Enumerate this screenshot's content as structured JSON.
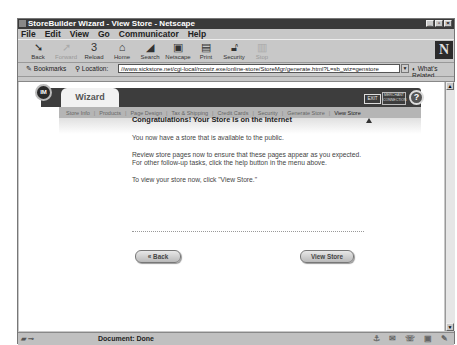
{
  "window": {
    "title": "StoreBuilder Wizard - View Store - Netscape",
    "controls": [
      "minimize",
      "maximize",
      "close"
    ]
  },
  "menu": [
    "File",
    "Edit",
    "View",
    "Go",
    "Communicator",
    "Help"
  ],
  "toolbar": [
    {
      "label": "Back",
      "icon": "back-icon",
      "disabled": false
    },
    {
      "label": "Forward",
      "icon": "forward-icon",
      "disabled": true
    },
    {
      "label": "Reload",
      "icon": "reload-icon",
      "disabled": false
    },
    {
      "label": "Home",
      "icon": "home-icon",
      "disabled": false
    },
    {
      "label": "Search",
      "icon": "search-icon",
      "disabled": false
    },
    {
      "label": "Netscape",
      "icon": "netscape-icon",
      "disabled": false
    },
    {
      "label": "Print",
      "icon": "print-icon",
      "disabled": false
    },
    {
      "label": "Security",
      "icon": "security-icon",
      "disabled": false
    },
    {
      "label": "Stop",
      "icon": "stop-icon",
      "disabled": true
    }
  ],
  "location": {
    "bookmarks_label": "Bookmarks",
    "location_label": "Location:",
    "url": "//www.sickstore.net/cgi-local/rccwiz.exe/online-store/StoreMgr/generate.html?L=sb_wiz=genstore",
    "related_label": "What's Related"
  },
  "wizard": {
    "logo": "IM",
    "tab_label": "Wizard",
    "exit_label": "EXIT",
    "merchant_label": "MERCHANT CONNECTION",
    "help_label": "?",
    "nav": [
      "Store Info",
      "Products",
      "Page Design",
      "Tax & Shipping",
      "Credit Cards",
      "Security",
      "Generate Store",
      "View Store"
    ],
    "current_step": "View Store"
  },
  "body": {
    "heading": "Congratulations! Your Store is on the Internet",
    "p1": "You now have a store that is available to the public.",
    "p2": "Review store pages now to ensure that these pages appear as you expected. For other follow-up tasks, click the help button in the menu above.",
    "p3": "To view your store now, click \"View Store.\"",
    "back_label": "« Back",
    "view_label": "View Store"
  },
  "status": {
    "text": "Document: Done"
  }
}
